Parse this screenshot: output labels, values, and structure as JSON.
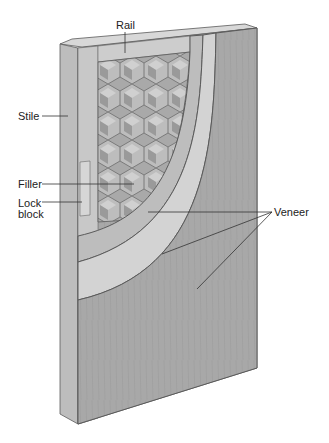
{
  "diagram": {
    "labels": {
      "rail": "Rail",
      "stile": "Stile",
      "filler": "Filler",
      "lock_block_line1": "Lock",
      "lock_block_line2": "block",
      "veneer": "Veneer"
    },
    "colors": {
      "background": "#ffffff",
      "frame_light": "#c8c8c8",
      "frame_edge": "#b4b4b4",
      "frame_top": "#d8d8d8",
      "core_honeycomb": "#a9a9a9",
      "honeycomb_light": "#c4c4c4",
      "veneer_inner": "#bdbdbd",
      "veneer_middle": "#cfcfcf",
      "veneer_outer": "#a5a5a5",
      "outline": "#5a5a5a",
      "leader_line": "#333333",
      "text": "#222222"
    }
  }
}
